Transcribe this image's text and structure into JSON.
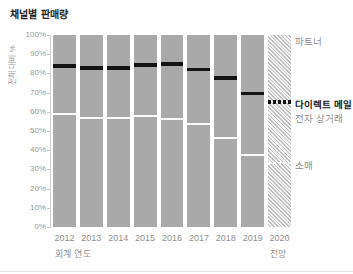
{
  "title": "채널별 판매량",
  "axes": {
    "y_label": "전체 대비 %",
    "x_label": "회계 연도",
    "y_ticks": [
      "100%",
      "90%",
      "80%",
      "70%",
      "60%",
      "50%",
      "40%",
      "30%",
      "20%",
      "10%",
      "0%"
    ]
  },
  "legend": {
    "partner": "파트너",
    "direct_mail": "다이렉트 메일",
    "ecommerce": "전자 상거래",
    "retail": "소매"
  },
  "forecast_caption": "전망",
  "colors": {
    "bar_fill": "#a9a9a9",
    "direct_mail_band": "#141414",
    "segment_divider": "#fcfcfc",
    "axis_text": "#9a9a9a",
    "title_text": "#222222",
    "legend_text": "#8f8f8f",
    "legend_emphasis": "#1a1a1a"
  },
  "chart_data": {
    "type": "bar",
    "stacked": true,
    "title": "채널별 판매량",
    "xlabel": "회계 연도",
    "ylabel": "전체 대비 %",
    "ylim": [
      0,
      100
    ],
    "grid": false,
    "legend_position": "right",
    "categories": [
      "2012",
      "2013",
      "2014",
      "2015",
      "2016",
      "2017",
      "2018",
      "2019",
      "2020"
    ],
    "series": [
      {
        "name": "소매",
        "values": [
          59,
          57,
          57,
          58,
          56,
          53.5,
          46.5,
          37.5,
          33.5
        ]
      },
      {
        "name": "전자 상거래",
        "values": [
          24,
          25,
          25,
          25.5,
          28,
          27.5,
          30,
          31,
          30.5
        ]
      },
      {
        "name": "다이렉트 메일",
        "values": [
          2,
          2,
          2,
          2,
          2,
          2,
          2,
          2,
          2
        ]
      },
      {
        "name": "파트너",
        "values": [
          15,
          16,
          16,
          14.5,
          14,
          17,
          21.5,
          29.5,
          34
        ]
      }
    ],
    "forecast_categories": [
      "2020"
    ]
  }
}
